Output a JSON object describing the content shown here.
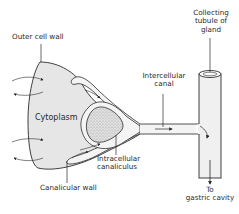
{
  "diagram": {
    "type": "anatomical-illustration",
    "labels": {
      "outer_cell_wall": "Outer cell wall",
      "collecting_tubule_1": "Collecting",
      "collecting_tubule_2": "tubule of",
      "collecting_tubule_3": "gland",
      "intercellular_canal_1": "Intercellular",
      "intercellular_canal_2": "canal",
      "cytoplasm": "Cytoplasm",
      "intracellular_canaliculus_1": "Intracellular",
      "intracellular_canaliculus_2": "canaliculus",
      "canalicular_wall": "Canalicular wall",
      "to_gastric_cavity_1": "To",
      "to_gastric_cavity_2": "gastric cavity"
    },
    "colors": {
      "line": "#2a2a2a",
      "cytoplasm_fill": "#e6e6e6",
      "nucleus_fill": "#d8d8d8",
      "canal_fill": "#f4f4f4"
    }
  }
}
